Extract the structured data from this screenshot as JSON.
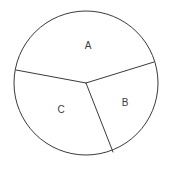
{
  "figure": {
    "type": "circle-divided-into-sectors",
    "background_color": "#ffffff",
    "stroke_color": "#3a3a3a",
    "stroke_width": 1,
    "canvas": {
      "width": 172,
      "height": 172
    },
    "circle": {
      "cx": 86,
      "cy": 83,
      "r": 72
    },
    "center_vertex": {
      "x": 86,
      "y": 83
    }
  },
  "chart_data": {
    "type": "pie",
    "title": "",
    "subtitle": "",
    "xlabel": "",
    "ylabel": "",
    "grid": false,
    "legend_position": "none",
    "center": {
      "x": 86,
      "y": 83
    },
    "radius": 72,
    "categories": [
      "A",
      "B",
      "C"
    ],
    "labels": [
      "A",
      "B",
      "C"
    ],
    "boundary_angles_deg": [
      -17,
      71,
      173
    ],
    "values": [
      88,
      102,
      170
    ],
    "units": "degrees",
    "slices": [
      {
        "label": "A",
        "start_angle_deg": 173,
        "end_angle_deg": 343,
        "sweep_deg": 88,
        "label_position": {
          "x": 88,
          "y": 46
        }
      },
      {
        "label": "B",
        "start_angle_deg": -17,
        "end_angle_deg": 71,
        "sweep_deg": 102,
        "label_position": {
          "x": 125,
          "y": 103
        }
      },
      {
        "label": "C",
        "start_angle_deg": 71,
        "end_angle_deg": 173,
        "sweep_deg": 170,
        "label_position": {
          "x": 61,
          "y": 110
        }
      }
    ],
    "radii": [
      {
        "name": "radius-upper-right",
        "from": {
          "x": 86,
          "y": 83
        },
        "to": {
          "x": 154,
          "y": 62
        }
      },
      {
        "name": "radius-left",
        "from": {
          "x": 86,
          "y": 83
        },
        "to": {
          "x": 16,
          "y": 70
        }
      },
      {
        "name": "radius-bottom",
        "from": {
          "x": 86,
          "y": 83
        },
        "to": {
          "x": 113,
          "y": 152
        }
      }
    ]
  }
}
